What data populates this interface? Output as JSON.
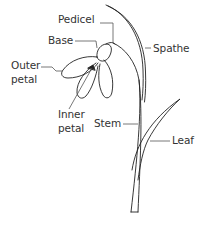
{
  "diagram": {
    "labels": {
      "pedicel": "Pedicel",
      "base": "Base",
      "spathe": "Spathe",
      "outer_petal_line1": "Outer",
      "outer_petal_line2": "petal",
      "inner_petal_line1": "Inner",
      "inner_petal_line2": "petal",
      "stem": "Stem",
      "leaf": "Leaf"
    },
    "colors": {
      "stroke": "#222222",
      "label_text": "#333333",
      "leader_line": "#555555",
      "background": "#ffffff"
    }
  }
}
